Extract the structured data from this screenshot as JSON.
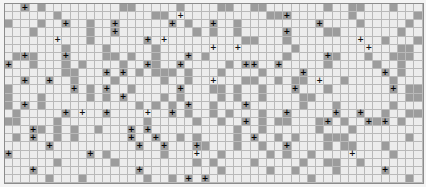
{
  "board": {
    "columns": 51,
    "rows": 22,
    "legend": {
      ".": "empty",
      "#": "filled",
      "*": "filled-with-marker",
      "+": "empty-with-marker"
    },
    "colors": {
      "empty": "#ececec",
      "filled": "#9c9c9c",
      "gridline": "#b9b9b9",
      "marker": "#111111"
    },
    "marker_glyph": "+",
    "grid": [
      "..*.#.........##.....#....##..##.......#..##...#...",
      "......#...........##.+..........##*.......#.......#.",
      "#...#..*..#..*......*.#..*..#.........*....#.....#.",
      "...#......#..*.........#.#..#.....*....##.......#..",
      "......+...#......*.+.........##...#........+..#...#",
      ".......#....#.....#......+..+......#........+...##.",
      ".#*#...*....##.#..#...*.#.........#....*#...#..###.",
      "*..#...#.#....#..*#..*.....#.**..*.....#.....#..#..",
      ".......##...*.*.#.###.#...#....#....*.........*.#..",
      "..*..*..#....#.....#..#..+...##..#.##.+..#.....#...",
      "#.......*.#.*..#.....*...##.#..#...*...#.......*.##",
      "#...#.....#.#.*....#.#....#.#..#....##...........##",
      "#.*.#...........#.#.#.*..#...*......#...#......#...",
      ".#.....*.+..*....+..*.#..#.#...#..*.....*..*..#..##",
      "##....#..........#.....#..#..*.#.##...#*.#..*#*.#..",
      "...*#.#.#..#...*.*..........#..#......#...#........",
      ".#.*..#.#......*..*..#.#....#.*..#.#...###.......#.",
      ".....*..........*..*...*#...#..#..*....#.##...#....",
      "*.........*.#......#...+..#.....#.#..#....+....#...",
      "......#......#.........#.#....#.....#..##..#.......",
      "...*............*.........#.....#..#....#.....*....",
      ".....#...#.......#..#.*.*............#...........#."
    ]
  }
}
